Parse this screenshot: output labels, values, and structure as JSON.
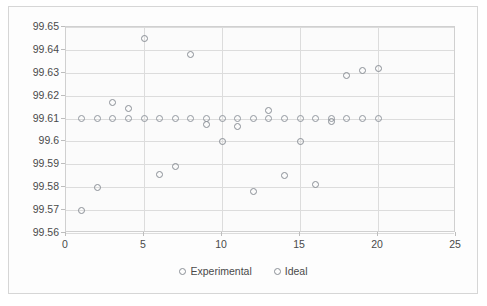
{
  "chart_data": {
    "type": "scatter",
    "title": "",
    "xlabel": "",
    "ylabel": "",
    "xlim": [
      0,
      25
    ],
    "ylim": [
      99.56,
      99.65
    ],
    "xticks": [
      0,
      5,
      10,
      15,
      20,
      25
    ],
    "ytick_labels": [
      "99.65",
      "99.64",
      "99.63",
      "99.62",
      "99.61",
      "99.6",
      "99.59",
      "99.58",
      "99.57",
      "99.56"
    ],
    "yticks": [
      99.65,
      99.64,
      99.63,
      99.62,
      99.61,
      99.6,
      99.59,
      99.58,
      99.57,
      99.56
    ],
    "grid": true,
    "legend_position": "bottom",
    "x": [
      1,
      2,
      3,
      4,
      5,
      6,
      7,
      8,
      9,
      10,
      11,
      12,
      13,
      14,
      15,
      16,
      17,
      18,
      19,
      20
    ],
    "series": [
      {
        "name": "Experimental",
        "marker": "open-circle",
        "color": "#8a8f96",
        "values": [
          99.57,
          99.58,
          99.617,
          99.6145,
          99.645,
          99.5855,
          99.589,
          99.638,
          99.6075,
          99.6,
          99.6065,
          99.578,
          99.6135,
          99.585,
          99.6,
          99.581,
          99.6085,
          99.629,
          99.631,
          99.632
        ]
      },
      {
        "name": "Ideal",
        "marker": "open-circle",
        "color": "#92989f",
        "values": [
          99.61,
          99.61,
          99.61,
          99.61,
          99.61,
          99.61,
          99.61,
          99.61,
          99.61,
          99.61,
          99.61,
          99.61,
          99.61,
          99.61,
          99.61,
          99.61,
          99.61,
          99.61,
          99.61,
          99.61
        ]
      }
    ]
  },
  "legend": {
    "entries": [
      {
        "label": "Experimental"
      },
      {
        "label": "Ideal"
      }
    ]
  }
}
